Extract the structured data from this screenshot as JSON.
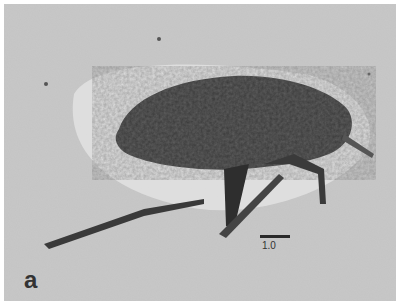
{
  "figure": {
    "panel_label": "a",
    "scale_bar_label": "1.0",
    "colors": {
      "matrix": "#c9c9c9",
      "halo": "#e4e4e4",
      "fossil": "#3a3a3a"
    }
  }
}
